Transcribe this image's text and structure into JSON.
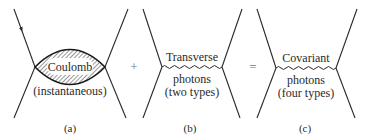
{
  "diagrams": [
    {
      "id": "a",
      "caption": "(a)",
      "interaction": "Coulomb",
      "sublabel": "(instantaneous)",
      "style": "hatched-lens"
    },
    {
      "id": "b",
      "caption": "(b)",
      "label_top": "Transverse",
      "label_line1": "photons",
      "label_line2": "(two types)",
      "style": "wavy-photon"
    },
    {
      "id": "c",
      "caption": "(c)",
      "label_top": "Covariant",
      "label_line1": "photons",
      "label_line2": "(four types)",
      "style": "wavy-photon"
    }
  ],
  "operators": [
    "+",
    "="
  ],
  "colors": {
    "ink": "#2a2a2a",
    "operator": "#777777",
    "background": "#ffffff"
  }
}
